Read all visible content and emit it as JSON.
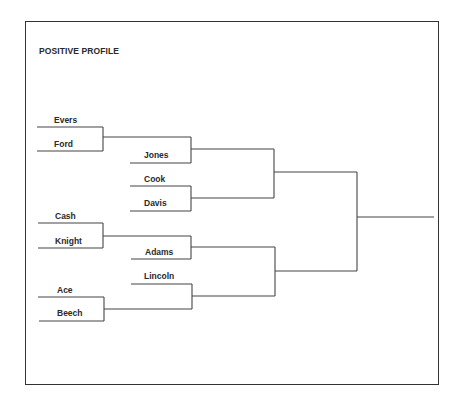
{
  "title": "POSITIVE PROFILE",
  "bracket": {
    "round1": [
      {
        "name": "Evers"
      },
      {
        "name": "Ford"
      },
      {
        "name": "Cash"
      },
      {
        "name": "Knight"
      },
      {
        "name": "Ace"
      },
      {
        "name": "Beech"
      }
    ],
    "round2": [
      {
        "name": "Jones"
      },
      {
        "name": "Cook"
      },
      {
        "name": "Davis"
      },
      {
        "name": "Adams"
      },
      {
        "name": "Lincoln"
      }
    ]
  },
  "colors": {
    "line": "#444444",
    "text": "#2a2a2a",
    "background": "#ffffff"
  }
}
